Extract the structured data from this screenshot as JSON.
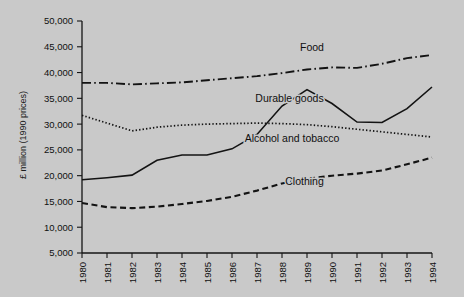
{
  "chart_data": {
    "type": "line",
    "title": "",
    "xlabel": "",
    "ylabel": "£ million (1990 prices)",
    "x": [
      1980,
      1981,
      1982,
      1983,
      1984,
      1985,
      1986,
      1987,
      1988,
      1989,
      1990,
      1991,
      1992,
      1993,
      1994
    ],
    "xtick_labels": [
      "1980",
      "1981",
      "1982",
      "1983",
      "1984",
      "1985",
      "1986",
      "1987",
      "1988",
      "1989",
      "1990",
      "1991",
      "1992",
      "1993",
      "1994"
    ],
    "ytick_labels": [
      "5,000",
      "10,000",
      "15,000",
      "20,000",
      "25,000",
      "30,000",
      "35,000",
      "40,000",
      "45,000",
      "50,000"
    ],
    "ytick_values": [
      5000,
      10000,
      15000,
      20000,
      25000,
      30000,
      35000,
      40000,
      45000,
      50000
    ],
    "ylim": [
      5000,
      50000
    ],
    "xlim": [
      1980,
      1994
    ],
    "grid": false,
    "legend_position": "inline-annotations",
    "series": [
      {
        "name": "Food",
        "style": "dash-dot",
        "label_x": 1989.2,
        "label_y": 44200,
        "values": [
          38000,
          38000,
          37700,
          37900,
          38100,
          38500,
          38900,
          39300,
          39900,
          40600,
          41000,
          40900,
          41700,
          42800,
          43400
        ]
      },
      {
        "name": "Alcohol and tobacco",
        "style": "dotted",
        "label_x": 1988.4,
        "label_y": 26600,
        "values": [
          31700,
          30200,
          28700,
          29400,
          29800,
          30000,
          30100,
          30200,
          30100,
          29900,
          29500,
          29000,
          28500,
          28000,
          27500
        ]
      },
      {
        "name": "Durable goods",
        "style": "solid",
        "label_x": 1988.3,
        "label_y": 34200,
        "values": [
          19200,
          19600,
          20100,
          23000,
          24000,
          24000,
          25200,
          28000,
          33500,
          36700,
          34000,
          30400,
          30300,
          33000,
          37200
        ]
      },
      {
        "name": "Clothing",
        "style": "dashed",
        "label_x": 1988.9,
        "label_y": 18100,
        "values": [
          14700,
          13900,
          13700,
          14000,
          14500,
          15100,
          15900,
          17100,
          18500,
          19400,
          20000,
          20400,
          21000,
          22200,
          23500
        ]
      }
    ]
  }
}
